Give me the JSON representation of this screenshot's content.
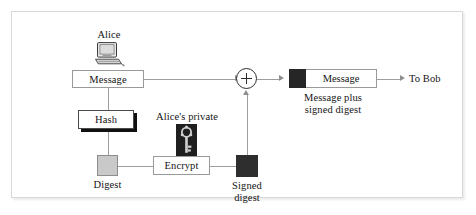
{
  "diagram": {
    "type": "flow-diagram",
    "sender_label": "Alice",
    "message_box_label": "Message",
    "hash_box_label": "Hash",
    "digest_label": "Digest",
    "key_caption": "Alice's private",
    "encrypt_box_label": "Encrypt",
    "signed_digest_label_line1": "Signed",
    "signed_digest_label_line2": "digest",
    "combiner_symbol": "+",
    "output_message_label": "Message",
    "output_caption_line1": "Message plus",
    "output_caption_line2": "signed digest",
    "destination_label": "To Bob",
    "icons": {
      "computer": "computer-icon",
      "key": "key-icon",
      "combiner": "plus-circle-icon"
    },
    "colors": {
      "frame_border": "#d8d8d8",
      "line": "#9e9e9e",
      "box_border": "#9a9a9a",
      "digest_fill": "#c9c9c9",
      "signed_digest_fill": "#2e2e2e",
      "shadow": "#111111",
      "text": "#141414",
      "background": "#ffffff"
    }
  }
}
